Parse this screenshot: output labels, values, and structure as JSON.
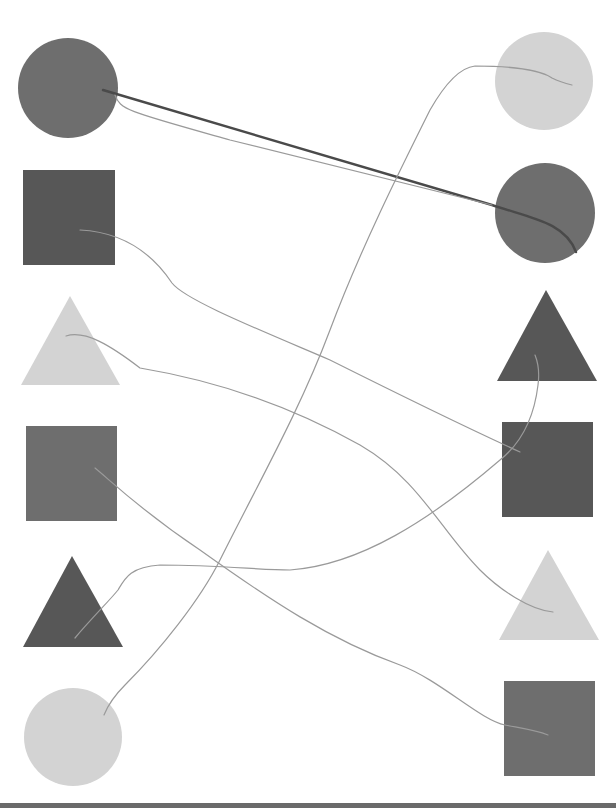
{
  "worksheet": {
    "type": "shape-matching",
    "background": "#ffffff",
    "colors": {
      "dark": "#575757",
      "mid": "#6e6e6e",
      "light": "#d3d3d3",
      "line": "#9a9a9a",
      "line_dark": "#4a4a4a",
      "bottom_bar": "#6a6a6a"
    },
    "left_column": [
      {
        "id": "L1",
        "shape": "circle",
        "shade": "mid",
        "cx": 68,
        "cy": 88,
        "r": 50
      },
      {
        "id": "L2",
        "shape": "square",
        "shade": "dark",
        "x": 23,
        "y": 170,
        "w": 92,
        "h": 95
      },
      {
        "id": "L3",
        "shape": "triangle",
        "shade": "light",
        "points": "70,296 21,385 120,385"
      },
      {
        "id": "L4",
        "shape": "square",
        "shade": "mid",
        "x": 26,
        "y": 426,
        "w": 91,
        "h": 95
      },
      {
        "id": "L5",
        "shape": "triangle",
        "shade": "dark",
        "points": "72,556 23,647 123,647"
      },
      {
        "id": "L6",
        "shape": "circle",
        "shade": "light",
        "cx": 73,
        "cy": 737,
        "r": 49
      }
    ],
    "right_column": [
      {
        "id": "R1",
        "shape": "circle",
        "shade": "light",
        "cx": 544,
        "cy": 81,
        "r": 49
      },
      {
        "id": "R2",
        "shape": "circle",
        "shade": "mid",
        "cx": 545,
        "cy": 213,
        "r": 50
      },
      {
        "id": "R3",
        "shape": "triangle",
        "shade": "dark",
        "points": "546,290 497,381 597,381"
      },
      {
        "id": "R4",
        "shape": "square",
        "shade": "dark",
        "x": 502,
        "y": 422,
        "w": 91,
        "h": 95
      },
      {
        "id": "R5",
        "shape": "triangle",
        "shade": "light",
        "points": "548,550 499,640 599,640"
      },
      {
        "id": "R6",
        "shape": "square",
        "shade": "mid",
        "x": 504,
        "y": 681,
        "w": 91,
        "h": 95
      }
    ],
    "connections": [
      {
        "from": "L1",
        "to": "R2",
        "style": "thick",
        "path": "M103,90 L492,205 C530,218 565,222 576,252"
      },
      {
        "from": "L1",
        "to": "R2",
        "style": "thin",
        "path": "M115,95 C120,110 130,112 230,140 L492,205"
      },
      {
        "from": "L2",
        "to": "R4",
        "style": "thin",
        "path": "M80,230 C120,232 150,250 172,283 C185,300 260,330 330,360 C390,390 450,420 520,452"
      },
      {
        "from": "L3",
        "to": "R5",
        "style": "thin",
        "path": "M66,336 C85,330 110,345 140,368 C200,378 280,400 360,445 C420,480 440,530 480,570 C500,590 530,610 553,612"
      },
      {
        "from": "L4",
        "to": "R6",
        "style": "thin",
        "path": "M95,468 C110,480 140,510 200,550 C270,600 330,640 400,665 C440,680 480,720 505,725 C520,728 535,730 548,735"
      },
      {
        "from": "L5",
        "to": "R3",
        "style": "thin",
        "path": "M75,638 C90,620 110,600 118,590 C125,578 130,567 160,565 C220,565 260,570 290,570 C360,565 430,520 500,460 C525,440 535,410 538,385 C540,370 537,360 535,355"
      },
      {
        "from": "L6",
        "to": "R1",
        "style": "thin",
        "path": "M104,715 C108,705 115,695 125,685 C160,650 200,600 220,560 C260,480 300,410 330,330 C360,250 400,170 430,110 C450,75 465,67 475,66 C510,66 540,70 552,78 C560,82 568,84 572,85"
      }
    ]
  }
}
